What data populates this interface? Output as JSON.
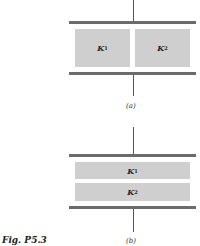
{
  "figure": {
    "label": "Fig. P5.3",
    "panel_a": {
      "caption": "(a)",
      "arrangement": "side-by-side",
      "dielectrics": [
        {
          "symbol": "K",
          "subscript": "1"
        },
        {
          "symbol": "K",
          "subscript": "2"
        }
      ]
    },
    "panel_b": {
      "caption": "(b)",
      "arrangement": "stacked",
      "dielectrics": [
        {
          "symbol": "K",
          "subscript": "1"
        },
        {
          "symbol": "K",
          "subscript": "2"
        }
      ]
    },
    "colors": {
      "plate": "#6b6b6b",
      "dielectric": "#cfcfcf",
      "wire": "#555555"
    }
  }
}
